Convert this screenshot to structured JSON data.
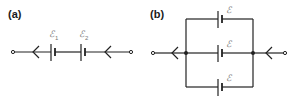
{
  "panels": [
    {
      "label": "(a)",
      "type": "series",
      "batteries": [
        {
          "symbol": "ℰ",
          "subscript": "1"
        },
        {
          "symbol": "ℰ",
          "subscript": "2"
        }
      ]
    },
    {
      "label": "(b)",
      "type": "parallel",
      "batteries": [
        {
          "symbol": "ℰ"
        },
        {
          "symbol": "ℰ"
        },
        {
          "symbol": "ℰ"
        }
      ]
    }
  ],
  "colors": {
    "wire": "#222222",
    "label_text": "#1a1a1a",
    "emf_text": "#777777"
  }
}
